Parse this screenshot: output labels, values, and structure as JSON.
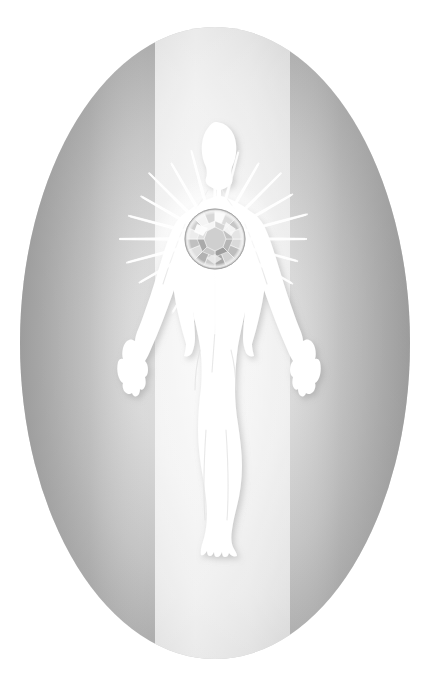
{
  "artwork": {
    "title": "Diamond Heart Light Body",
    "caption_top": "",
    "canvas": {
      "width": 431,
      "height": 675,
      "background": "#ffffff"
    }
  },
  "ellipse_backdrop": {
    "name": "aura-ellipse",
    "center_x": 215,
    "center_y": 343,
    "radius_x": 195,
    "radius_y": 316,
    "gradient_type": "radial-with-vertical-band",
    "color_edge": "#9b9b9b",
    "color_mid": "#b8b8b8",
    "color_inner": "#d4d4d4",
    "color_center": "#ededed"
  },
  "light_band": {
    "name": "vertical-light-band",
    "left_x": 155,
    "right_x": 290,
    "color_bright": "#f0f0f0",
    "color_soft": "#e2e2e2",
    "description": "bright vertical column of light through the ellipse center"
  },
  "figure": {
    "name": "human-silhouette",
    "color": "#ffffff",
    "pose": "standing, arms lowered and spread, fingers open, feet together and splayed",
    "head_center_x": 215,
    "head_top_y": 122,
    "feet_bottom_y": 556,
    "shoulder_y": 196,
    "hand_left_x": 128,
    "hand_right_x": 302,
    "hand_y": 352
  },
  "gem": {
    "name": "heart-diamond",
    "cut": "round brilliant",
    "center_x": 215,
    "center_y": 239,
    "radius": 30,
    "color_light": "#ffffff",
    "color_mid": "#c9c9c9",
    "color_dark": "#8e8e8e",
    "facet_count": 24
  },
  "light_rays": {
    "name": "radiating-light-rays",
    "count": 24,
    "origin_x": 215,
    "origin_y": 239,
    "inner_radius": 30,
    "outer_radius": 96,
    "color": "#ffffff",
    "glow_color": "#ffffff"
  },
  "palette": {
    "white": "#ffffff",
    "light_gray": "#ededed",
    "mid_gray": "#b8b8b8",
    "dark_gray": "#9b9b9b",
    "gem_shadow": "#8e8e8e"
  }
}
